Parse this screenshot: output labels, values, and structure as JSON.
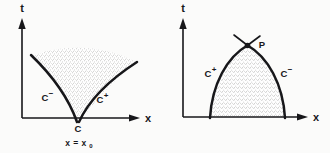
{
  "figure": {
    "background_color": "#fbfbfa",
    "ink_color": "#17171a",
    "fill_color": "#d7d7d4",
    "panels": [
      {
        "id": "left",
        "name": "diverging-characteristics-rarefaction",
        "axes": {
          "x_label": "x",
          "y_label": "t",
          "x_arrow": true,
          "y_arrow": true
        },
        "curves": [
          {
            "name": "c-minus",
            "base": "C",
            "superscript": "−",
            "label": "C−"
          },
          {
            "name": "c-plus",
            "base": "C",
            "superscript": "+",
            "label": "C+"
          }
        ],
        "points": [
          {
            "name": "origin-point-C",
            "label": "C"
          }
        ],
        "annotations": [
          {
            "name": "x-equals-x0",
            "base": "x = x",
            "subscript": "0",
            "label": "x = x₀"
          }
        ],
        "region": {
          "name": "stippled-fan-region",
          "shaded": true
        }
      },
      {
        "id": "right",
        "name": "converging-characteristics-shock",
        "axes": {
          "x_label": "x",
          "y_label": "t",
          "x_arrow": true,
          "y_arrow": true
        },
        "curves": [
          {
            "name": "c-plus",
            "base": "C",
            "superscript": "+",
            "label": "C+"
          },
          {
            "name": "c-minus",
            "base": "C",
            "superscript": "−",
            "label": "C−"
          }
        ],
        "points": [
          {
            "name": "intersection-point-P",
            "label": "P"
          }
        ],
        "annotations": [],
        "region": {
          "name": "stippled-dome-region",
          "shaded": true
        }
      }
    ]
  }
}
